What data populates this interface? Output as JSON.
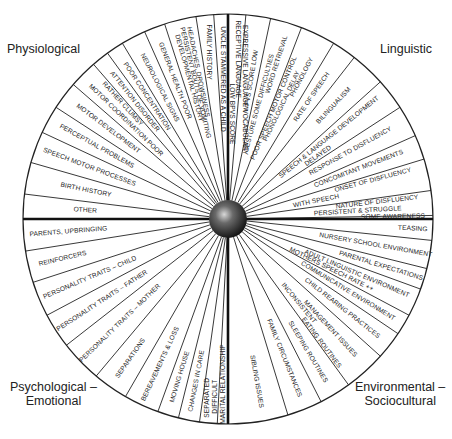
{
  "quadrants": {
    "physiological": "Physiological",
    "linguistic": "Linguistic",
    "psychological": [
      "Psychological –",
      "Emotional"
    ],
    "environmental": [
      "Environmental –",
      "Sociocultural"
    ]
  },
  "wheel": {
    "center": [
      228,
      219
    ],
    "radius": 205,
    "hub_radius": 19,
    "line_color": "#222222",
    "axis_color": "#111111",
    "hub_color": "#2a2a2a"
  },
  "segments": [
    {
      "quadrant": "physiological",
      "boundary": 187,
      "labels": [
        {
          "text": "OTHER",
          "angle": 183.5,
          "r": 143
        }
      ]
    },
    {
      "quadrant": "physiological",
      "boundary": 196,
      "labels": [
        {
          "text": "BIRTH HISTORY",
          "angle": 191.5,
          "r": 145
        }
      ]
    },
    {
      "quadrant": "physiological",
      "boundary": 205,
      "labels": [
        {
          "text": "SPEECH MOTOR PROCESSES",
          "angle": 200.5,
          "r": 148
        }
      ]
    },
    {
      "quadrant": "physiological",
      "boundary": 213,
      "labels": [
        {
          "text": "PERCEPTUAL PROBLEMS",
          "angle": 209,
          "r": 150
        }
      ]
    },
    {
      "quadrant": "physiological",
      "boundary": 221,
      "labels": [
        {
          "text": "MOTOR DEVELOPMENT",
          "angle": 217,
          "r": 150
        }
      ]
    },
    {
      "quadrant": "physiological",
      "boundary": 229,
      "labels": [
        {
          "text": "MOTOR COORDINATION POOR",
          "angle": 224,
          "r": 142
        },
        {
          "text": "RATHER CLUMSY",
          "angle": 227.5,
          "r": 156
        }
      ]
    },
    {
      "quadrant": "physiological",
      "boundary": 234,
      "labels": [
        {
          "text": "ATTENTION DISORDER",
          "angle": 231.5,
          "r": 150
        }
      ]
    },
    {
      "quadrant": "physiological",
      "boundary": 239,
      "labels": [
        {
          "text": "POOR CONCENTRATION",
          "angle": 236.5,
          "r": 147
        }
      ]
    },
    {
      "quadrant": "physiological",
      "boundary": 246,
      "labels": [
        {
          "text": "NEUROLOGICAL SIGNS",
          "angle": 242.5,
          "r": 148
        }
      ]
    },
    {
      "quadrant": "physiological",
      "boundary": 252,
      "labels": [
        {
          "text": "GENERAL HEALTH POOR",
          "angle": 249,
          "r": 148
        }
      ]
    },
    {
      "quadrant": "physiological",
      "boundary": 261,
      "labels": [
        {
          "text": "DEVELOPMENTAL HISTORY",
          "angle": 254.5,
          "r": 146
        },
        {
          "text": "PERSISTENT BOUTS OF VOMITING",
          "angle": 256.5,
          "r": 140
        },
        {
          "text": "HEADACHES, DROWSINESS",
          "angle": 258.5,
          "r": 150
        }
      ]
    },
    {
      "quadrant": "physiological",
      "boundary": 266,
      "labels": [
        {
          "text": "FAMILY HISTORY",
          "angle": 263.5,
          "r": 168
        }
      ]
    },
    {
      "quadrant": "physiological",
      "boundary": 270,
      "labels": [
        {
          "text": "UNCLE STAMMERED AS A CHILD",
          "angle": 268,
          "r": 140
        }
      ]
    },
    {
      "quadrant": "linguistic",
      "boundary": 275,
      "labels": [
        {
          "text": "RECEPTIVE LANGUAGE",
          "angle": 273.5,
          "r": 160
        },
        {
          "text": "LOW BPVS SCORE",
          "angle": 272,
          "r": 105
        }
      ]
    },
    {
      "quadrant": "linguistic",
      "boundary": 282,
      "labels": [
        {
          "text": "EXPRESSIVE LANGUAGE VOCABULARY",
          "angle": 277.5,
          "r": 130
        },
        {
          "text": "WPVS SCORE LOW",
          "angle": 279.5,
          "r": 140
        }
      ]
    },
    {
      "quadrant": "linguistic",
      "boundary": 291,
      "labels": [
        {
          "text": "WORD RETRIEVAL",
          "angle": 287.5,
          "r": 162
        },
        {
          "text": "GESTURE SOME DIFFICULTIES",
          "angle": 285,
          "r": 120
        }
      ]
    },
    {
      "quadrant": "linguistic",
      "boundary": 301,
      "labels": [
        {
          "text": "PHONOLOGY",
          "angle": 297.5,
          "r": 160
        },
        {
          "text": "POOR SPEECH MOTOR CONTROL",
          "angle": 292.5,
          "r": 120
        },
        {
          "text": "PHONOLOGICAL DELAY",
          "angle": 295.5,
          "r": 125
        }
      ]
    },
    {
      "quadrant": "linguistic",
      "boundary": 308,
      "labels": [
        {
          "text": "RATE OF SPEECH",
          "angle": 304.5,
          "r": 148
        }
      ]
    },
    {
      "quadrant": "linguistic",
      "boundary": 318,
      "labels": [
        {
          "text": "BILINGUALISM",
          "angle": 313,
          "r": 155
        }
      ]
    },
    {
      "quadrant": "linguistic",
      "boundary": 327,
      "labels": [
        {
          "text": "SPEECH & LANGUAGE DEVELOPMENT",
          "angle": 321,
          "r": 130
        },
        {
          "text": "DELAYED",
          "angle": 325,
          "r": 110
        }
      ]
    },
    {
      "quadrant": "linguistic",
      "boundary": 336,
      "labels": [
        {
          "text": "RESPONSE TO DISFLUENCY",
          "angle": 331,
          "r": 140
        }
      ]
    },
    {
      "quadrant": "linguistic",
      "boundary": 343,
      "labels": [
        {
          "text": "CONCOMITANT MOVEMENTS",
          "angle": 339,
          "r": 140
        }
      ]
    },
    {
      "quadrant": "linguistic",
      "boundary": 352,
      "labels": [
        {
          "text": "ONSET OF DISFLUENCY",
          "angle": 345,
          "r": 150
        },
        {
          "text": "WITH SPEECH",
          "angle": 348.5,
          "r": 90
        }
      ]
    },
    {
      "quadrant": "linguistic",
      "boundary": 359,
      "labels": [
        {
          "text": "NATURE OF DISFLUENCY",
          "angle": 353.5,
          "r": 150
        },
        {
          "text": "PERSISTENT & STRUGGLE",
          "angle": 356.5,
          "r": 130
        }
      ]
    },
    {
      "quadrant": "linguistic",
      "boundary": 360,
      "labels": [
        {
          "text": "SOME AWARENESS",
          "angle": 359.2,
          "r": 165
        }
      ]
    },
    {
      "quadrant": "environmental",
      "boundary": 6,
      "labels": [
        {
          "text": "TEASING",
          "angle": 3,
          "r": 185
        }
      ]
    },
    {
      "quadrant": "environmental",
      "boundary": 14,
      "labels": [
        {
          "text": "NURSERY SCHOOL ENVIRONMENT",
          "angle": 10,
          "r": 150
        }
      ]
    },
    {
      "quadrant": "environmental",
      "boundary": 20,
      "labels": [
        {
          "text": "PARENTAL EXPECTATIONS",
          "angle": 17,
          "r": 160
        }
      ]
    },
    {
      "quadrant": "environmental",
      "boundary": 28,
      "labels": [
        {
          "text": "ADULT LINGUISTIC ENVIRONMENT",
          "angle": 23,
          "r": 140
        },
        {
          "text": "MOTHERS SPEECH RATE ++",
          "angle": 26,
          "r": 115
        }
      ]
    },
    {
      "quadrant": "environmental",
      "boundary": 34,
      "labels": [
        {
          "text": "COMMUNICATIVE ENVIRONMENT",
          "angle": 31,
          "r": 140
        }
      ]
    },
    {
      "quadrant": "environmental",
      "boundary": 42,
      "labels": [
        {
          "text": "CHILD REARING PRACTICES",
          "angle": 38,
          "r": 145
        }
      ]
    },
    {
      "quadrant": "environmental",
      "boundary": 54,
      "labels": [
        {
          "text": "MANAGEMENT ISSUES",
          "angle": 47,
          "r": 150
        },
        {
          "text": "INCONSISTENT",
          "angle": 50,
          "r": 110
        },
        {
          "text": "EATING ROUTINES",
          "angle": 53,
          "r": 155
        }
      ]
    },
    {
      "quadrant": "environmental",
      "boundary": 63,
      "labels": [
        {
          "text": "SLEEPING ROUTINES",
          "angle": 59,
          "r": 155
        }
      ]
    },
    {
      "quadrant": "environmental",
      "boundary": 73,
      "labels": [
        {
          "text": "FAMILY CIRCUMSTANCES",
          "angle": 68,
          "r": 150
        }
      ]
    },
    {
      "quadrant": "environmental",
      "boundary": 90,
      "labels": [
        {
          "text": "SIBLING ISSUES",
          "angle": 80,
          "r": 165
        }
      ]
    },
    {
      "quadrant": "psychological",
      "boundary": 93,
      "labels": [
        {
          "text": "MARITAL RELATIONSHIP",
          "angle": 91.5,
          "r": 165
        },
        {
          "text": "DIFFICULT",
          "angle": 94,
          "r": 178
        }
      ]
    },
    {
      "quadrant": "psychological",
      "boundary": 98,
      "labels": [
        {
          "text": "SEPARATED",
          "angle": 96.5,
          "r": 180
        }
      ]
    },
    {
      "quadrant": "psychological",
      "boundary": 104,
      "labels": [
        {
          "text": "CHANGES IN CARE",
          "angle": 101,
          "r": 165
        }
      ]
    },
    {
      "quadrant": "psychological",
      "boundary": 110,
      "labels": [
        {
          "text": "MOVING HOUSE",
          "angle": 107,
          "r": 165
        }
      ]
    },
    {
      "quadrant": "psychological",
      "boundary": 120,
      "labels": [
        {
          "text": "BEREAVEMENTS & LOSS",
          "angle": 115,
          "r": 160
        }
      ]
    },
    {
      "quadrant": "psychological",
      "boundary": 130,
      "labels": [
        {
          "text": "SEPARATIONS",
          "angle": 125,
          "r": 170
        }
      ]
    },
    {
      "quadrant": "psychological",
      "boundary": 142,
      "labels": [
        {
          "text": "PERSONALITY TRAITS – MOTHER",
          "angle": 136,
          "r": 150
        }
      ]
    },
    {
      "quadrant": "psychological",
      "boundary": 152,
      "labels": [
        {
          "text": "PERSONALITY TRAITS – FATHER",
          "angle": 147,
          "r": 150
        }
      ]
    },
    {
      "quadrant": "psychological",
      "boundary": 162,
      "labels": [
        {
          "text": "PERSONALITY TRAITS – CHILD",
          "angle": 157,
          "r": 150
        }
      ]
    },
    {
      "quadrant": "psychological",
      "boundary": 171,
      "labels": [
        {
          "text": "REINFORCERS",
          "angle": 166.5,
          "r": 170
        }
      ]
    },
    {
      "quadrant": "psychological",
      "boundary": 180,
      "labels": [
        {
          "text": "PARENTS, UPBRINGING",
          "angle": 175.5,
          "r": 160
        }
      ]
    }
  ]
}
